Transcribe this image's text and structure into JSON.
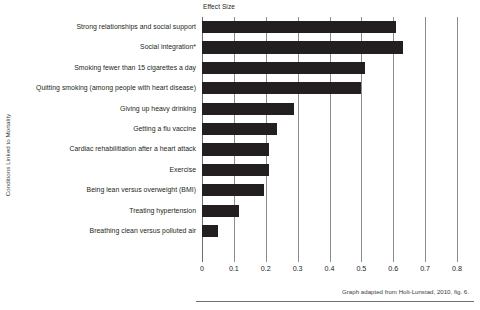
{
  "chart_data": {
    "type": "bar",
    "orientation": "horizontal",
    "title": "Effect Size",
    "xlabel": "Effect Size",
    "ylabel": "Conditions Linked to Mortality",
    "xlim": [
      0,
      0.8
    ],
    "x_ticks": [
      0,
      0.1,
      0.2,
      0.3,
      0.4,
      0.5,
      0.6,
      0.7,
      0.8
    ],
    "x_tick_labels": [
      "0",
      "0.1",
      "0.2",
      "0.3",
      "0.4",
      "0.5",
      "0.6",
      "0.7",
      "0.8"
    ],
    "grid": true,
    "legend": null,
    "bar_color": "#231f20",
    "categories": [
      "Strong relationships and social support",
      "Social integration*",
      "Smoking fewer than 15 cigarettes a day",
      "Quitting smoking (among people with heart disease)",
      "Giving up heavy drinking",
      "Getting a flu vaccine",
      "Cardiac rehabilitiation after a heart attack",
      "Exercise",
      "Being lean versus  overweight (BMI)",
      "Treating hypertension",
      "Breathing clean versus polluted air"
    ],
    "values": [
      0.61,
      0.63,
      0.51,
      0.5,
      0.29,
      0.235,
      0.21,
      0.21,
      0.195,
      0.115,
      0.05
    ],
    "annotation": "Graph adapted from Holt-Lunstad, 2010, fig. 6."
  }
}
